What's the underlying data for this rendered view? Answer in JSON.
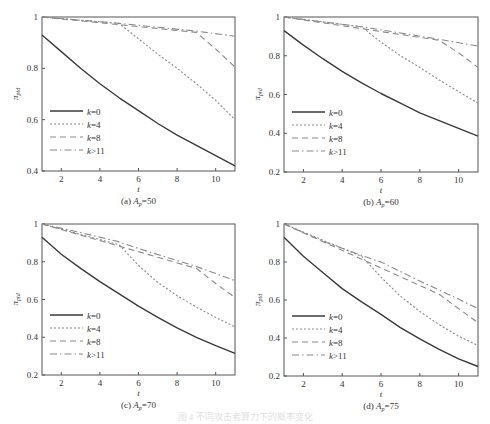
{
  "figure": {
    "caption": "图 4  不同攻击者算力下的概率变化",
    "legend": [
      "k=0",
      "k=4",
      "k=8",
      "k>11"
    ]
  },
  "chart_data": [
    {
      "type": "line",
      "panel": "(a)",
      "title": "(a) A_p=50",
      "subtitle_label": "(a)",
      "param_name": "A",
      "param_sub": "p",
      "param_value": "=50",
      "xlabel": "t",
      "ylabel": "π_ptd",
      "xlim": [
        1,
        11
      ],
      "ylim": [
        0.4,
        1
      ],
      "xticks": [
        2,
        4,
        6,
        8,
        10
      ],
      "yticks": [
        0.4,
        0.6,
        0.8,
        1
      ],
      "ytick_labels": [
        "0.4",
        "0.6",
        "0.8",
        "1"
      ],
      "grid": false,
      "legend_position": "lower left",
      "series": [
        {
          "name": "k=0",
          "style": "solid",
          "x": [
            1,
            2,
            3,
            4,
            5,
            6,
            7,
            8,
            9,
            10,
            11
          ],
          "y": [
            0.93,
            0.865,
            0.8,
            0.74,
            0.685,
            0.635,
            0.585,
            0.54,
            0.5,
            0.46,
            0.42
          ]
        },
        {
          "name": "k=4",
          "style": "dotted",
          "x": [
            1,
            5,
            6,
            7,
            8,
            9,
            10,
            11
          ],
          "y": [
            1.0,
            0.975,
            0.915,
            0.855,
            0.8,
            0.74,
            0.675,
            0.6
          ]
        },
        {
          "name": "k=8",
          "style": "dashed",
          "x": [
            1,
            9,
            10,
            11
          ],
          "y": [
            1.0,
            0.94,
            0.875,
            0.805
          ]
        },
        {
          "name": "k>11",
          "style": "dashdot",
          "x": [
            1,
            5,
            9,
            11
          ],
          "y": [
            1.0,
            0.975,
            0.945,
            0.925
          ]
        }
      ]
    },
    {
      "type": "line",
      "panel": "(b)",
      "title": "(b) A_p=60",
      "subtitle_label": "(b)",
      "param_name": "A",
      "param_sub": "p",
      "param_value": "=60",
      "xlabel": "t",
      "ylabel": "π_ptd",
      "xlim": [
        1,
        11
      ],
      "ylim": [
        0.2,
        1
      ],
      "xticks": [
        2,
        4,
        6,
        8,
        10
      ],
      "yticks": [
        0.2,
        0.4,
        0.6,
        0.8,
        1
      ],
      "ytick_labels": [
        "0.2",
        "0.4",
        "0.6",
        "0.8",
        "1"
      ],
      "grid": false,
      "legend_position": "lower left",
      "series": [
        {
          "name": "k=0",
          "style": "solid",
          "x": [
            1,
            2,
            3,
            4,
            5,
            6,
            7,
            8,
            9,
            10,
            11
          ],
          "y": [
            0.93,
            0.855,
            0.785,
            0.72,
            0.66,
            0.605,
            0.555,
            0.505,
            0.465,
            0.425,
            0.385
          ]
        },
        {
          "name": "k=4",
          "style": "dotted",
          "x": [
            1,
            5,
            6,
            7,
            8,
            9,
            10,
            11
          ],
          "y": [
            1.0,
            0.95,
            0.87,
            0.8,
            0.74,
            0.675,
            0.615,
            0.555
          ]
        },
        {
          "name": "k=8",
          "style": "dashed",
          "x": [
            1,
            9,
            10,
            11
          ],
          "y": [
            1.0,
            0.88,
            0.815,
            0.74
          ]
        },
        {
          "name": "k>11",
          "style": "dashdot",
          "x": [
            1,
            5,
            9,
            11
          ],
          "y": [
            1.0,
            0.95,
            0.885,
            0.85
          ]
        }
      ]
    },
    {
      "type": "line",
      "panel": "(c)",
      "title": "(c) A_p=70",
      "subtitle_label": "(c)",
      "param_name": "A",
      "param_sub": "p",
      "param_value": "=70",
      "xlabel": "t",
      "ylabel": "π_ptd",
      "xlim": [
        1,
        11
      ],
      "ylim": [
        0.2,
        1
      ],
      "xticks": [
        2,
        4,
        6,
        8,
        10
      ],
      "yticks": [
        0.2,
        0.4,
        0.6,
        0.8,
        1
      ],
      "ytick_labels": [
        "0.2",
        "0.4",
        "0.6",
        "0.8",
        "1"
      ],
      "grid": false,
      "legend_position": "lower left",
      "series": [
        {
          "name": "k=0",
          "style": "solid",
          "x": [
            1,
            2,
            3,
            4,
            5,
            6,
            7,
            8,
            9,
            10,
            11
          ],
          "y": [
            0.93,
            0.84,
            0.765,
            0.695,
            0.63,
            0.565,
            0.505,
            0.45,
            0.4,
            0.355,
            0.315
          ]
        },
        {
          "name": "k=4",
          "style": "dotted",
          "x": [
            1,
            5,
            6,
            7,
            8,
            9,
            10,
            11
          ],
          "y": [
            1.0,
            0.89,
            0.78,
            0.69,
            0.62,
            0.56,
            0.505,
            0.455
          ]
        },
        {
          "name": "k=8",
          "style": "dashed",
          "x": [
            1,
            9,
            10,
            11
          ],
          "y": [
            1.0,
            0.765,
            0.685,
            0.61
          ]
        },
        {
          "name": "k>11",
          "style": "dashdot",
          "x": [
            1,
            3,
            5,
            6,
            9,
            11
          ],
          "y": [
            1.0,
            0.955,
            0.905,
            0.87,
            0.775,
            0.7
          ]
        }
      ]
    },
    {
      "type": "line",
      "panel": "(d)",
      "title": "(d) A_p=75",
      "subtitle_label": "(d)",
      "param_name": "A",
      "param_sub": "p",
      "param_value": "=75",
      "xlabel": "t",
      "ylabel": "π_ptd",
      "xlim": [
        1,
        11
      ],
      "ylim": [
        0.2,
        1
      ],
      "xticks": [
        2,
        4,
        6,
        8,
        10
      ],
      "yticks": [
        0.2,
        0.4,
        0.6,
        0.8,
        1
      ],
      "ytick_labels": [
        "0.2",
        "0.4",
        "0.6",
        "0.8",
        "1"
      ],
      "grid": false,
      "legend_position": "lower left",
      "series": [
        {
          "name": "k=0",
          "style": "solid",
          "x": [
            1,
            2,
            3,
            4,
            5,
            6,
            7,
            8,
            9,
            10,
            11
          ],
          "y": [
            0.93,
            0.83,
            0.745,
            0.66,
            0.59,
            0.525,
            0.455,
            0.395,
            0.34,
            0.29,
            0.25
          ]
        },
        {
          "name": "k=4",
          "style": "dotted",
          "x": [
            1,
            5,
            6,
            7,
            8,
            9,
            10,
            11
          ],
          "y": [
            1.0,
            0.83,
            0.72,
            0.62,
            0.54,
            0.47,
            0.41,
            0.36
          ]
        },
        {
          "name": "k=8",
          "style": "dashed",
          "x": [
            1,
            9,
            10,
            11
          ],
          "y": [
            1.0,
            0.63,
            0.555,
            0.48
          ]
        },
        {
          "name": "k>11",
          "style": "dashdot",
          "x": [
            1,
            3,
            5,
            6,
            8,
            10,
            11
          ],
          "y": [
            1.0,
            0.91,
            0.835,
            0.8,
            0.7,
            0.605,
            0.555
          ]
        }
      ]
    }
  ]
}
